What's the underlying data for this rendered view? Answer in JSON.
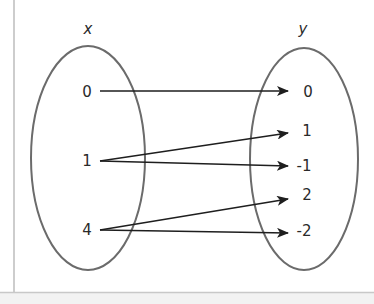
{
  "diagram": {
    "type": "mapping-diagram",
    "domain_set": {
      "label": "x",
      "elements": [
        "0",
        "1",
        "4"
      ]
    },
    "codomain_set": {
      "label": "y",
      "elements": [
        "0",
        "1",
        "-1",
        "2",
        "-2"
      ]
    },
    "mappings": [
      {
        "from": "0",
        "to": "0"
      },
      {
        "from": "1",
        "to": "1"
      },
      {
        "from": "1",
        "to": "-1"
      },
      {
        "from": "4",
        "to": "2"
      },
      {
        "from": "4",
        "to": "-2"
      }
    ],
    "colors": {
      "ellipse_stroke": "#6b6b6b",
      "arrow": "#1e1e1e",
      "text": "#2a2a2a",
      "frame": "#bdbdbd",
      "footer_bg": "#f2f2f2"
    }
  }
}
